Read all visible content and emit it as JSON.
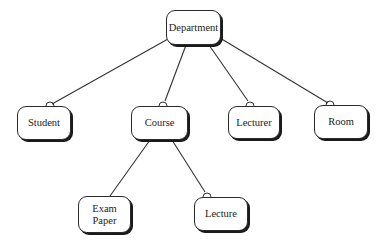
{
  "diagram": {
    "type": "hierarchy",
    "nodes": [
      {
        "id": "department",
        "label": "Department",
        "x": 166,
        "y": 10,
        "w": 55,
        "h": 35
      },
      {
        "id": "student",
        "label": "Student",
        "x": 17,
        "y": 106,
        "w": 54,
        "h": 34
      },
      {
        "id": "course",
        "label": "Course",
        "x": 131,
        "y": 106,
        "w": 57,
        "h": 34
      },
      {
        "id": "lecturer",
        "label": "Lecturer",
        "x": 228,
        "y": 106,
        "w": 52,
        "h": 33
      },
      {
        "id": "room",
        "label": "Room",
        "x": 314,
        "y": 105,
        "w": 54,
        "h": 34
      },
      {
        "id": "exam_paper",
        "label": "Exam\nPaper",
        "x": 78,
        "y": 196,
        "w": 53,
        "h": 37
      },
      {
        "id": "lecture",
        "label": "Lecture",
        "x": 194,
        "y": 197,
        "w": 54,
        "h": 34
      }
    ],
    "edges": [
      {
        "from": "department",
        "to": "student",
        "x1": 168,
        "y1": 39,
        "x2": 52,
        "y2": 104,
        "end_marker": "semicircle",
        "mx": 50,
        "my": 106
      },
      {
        "from": "department",
        "to": "course",
        "x1": 186,
        "y1": 45,
        "x2": 165,
        "y2": 101,
        "end_marker": "semicircle",
        "mx": 163,
        "my": 106
      },
      {
        "from": "department",
        "to": "lecturer",
        "x1": 209,
        "y1": 45,
        "x2": 248,
        "y2": 101,
        "end_marker": "semicircle",
        "mx": 250,
        "my": 106
      },
      {
        "from": "department",
        "to": "room",
        "x1": 220,
        "y1": 38,
        "x2": 328,
        "y2": 103,
        "end_marker": "semicircle",
        "mx": 330,
        "my": 105
      },
      {
        "from": "course",
        "to": "exam_paper",
        "x1": 150,
        "y1": 140,
        "x2": 110,
        "y2": 196,
        "end_marker": "none"
      },
      {
        "from": "course",
        "to": "lecture",
        "x1": 172,
        "y1": 140,
        "x2": 205,
        "y2": 192,
        "end_marker": "semicircle",
        "mx": 207,
        "my": 197
      }
    ],
    "colors": {
      "line": "#333333",
      "box_border": "#2a2a2a",
      "shadow": "#1a1a1a",
      "text": "#222222",
      "background": "#ffffff"
    }
  }
}
